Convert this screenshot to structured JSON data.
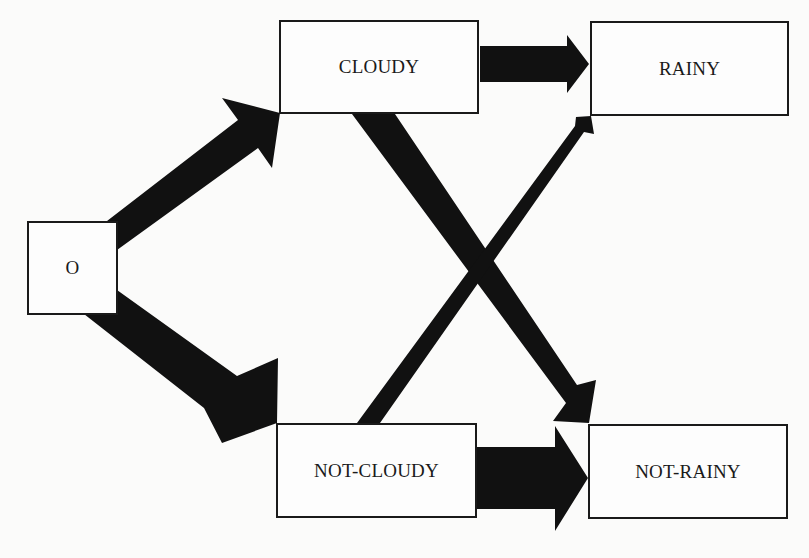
{
  "diagram": {
    "type": "state-transition-diagram",
    "colors": {
      "background": "#fbfbfa",
      "box_fill": "#fdfdfd",
      "box_border": "#1a1a1a",
      "arrow": "#111111",
      "text": "#1a1a1a"
    },
    "nodes": [
      {
        "id": "O",
        "label": "O",
        "x": 27,
        "y": 221,
        "w": 91,
        "h": 94
      },
      {
        "id": "CLOUDY",
        "label": "CLOUDY",
        "x": 279,
        "y": 20,
        "w": 200,
        "h": 94
      },
      {
        "id": "RAINY",
        "label": "RAINY",
        "x": 590,
        "y": 21,
        "w": 199,
        "h": 95
      },
      {
        "id": "NOT-CLOUDY",
        "label": "NOT-CLOUDY",
        "x": 276,
        "y": 423,
        "w": 201,
        "h": 95
      },
      {
        "id": "NOT-RAINY",
        "label": "NOT-RAINY",
        "x": 588,
        "y": 424,
        "w": 200,
        "h": 95
      }
    ],
    "edges": [
      {
        "from": "O",
        "to": "CLOUDY",
        "weight": "thick",
        "path": "M107,221 L117,250 L258,148 L272,168 L280,113 L222,98 L238,120 Z"
      },
      {
        "from": "O",
        "to": "NOT-CLOUDY",
        "weight": "very-thick",
        "path": "M84,314 L117,290 L237,376 L278,358 L277,423 L222,443 L204,408 Z"
      },
      {
        "from": "CLOUDY",
        "to": "RAINY",
        "weight": "thick",
        "path": "M480,46 L567,46 L567,35 L589,64 L567,93 L567,82 L480,82 Z"
      },
      {
        "from": "CLOUDY",
        "to": "NOT-RAINY",
        "weight": "thick",
        "path": "M352,114 L395,114 L577,385 L596,380 L589,423 L553,421 L566,403 Z"
      },
      {
        "from": "NOT-CLOUDY",
        "to": "RAINY",
        "weight": "thin",
        "path": "M357,423 L380,423 L584,132 L594,134 L591,116 L576,117 L575,126 Z"
      },
      {
        "from": "NOT-CLOUDY",
        "to": "NOT-RAINY",
        "weight": "very-thick",
        "path": "M477,447 L555,447 L555,426 L588,478 L555,531 L555,509 L477,509 Z"
      }
    ]
  }
}
